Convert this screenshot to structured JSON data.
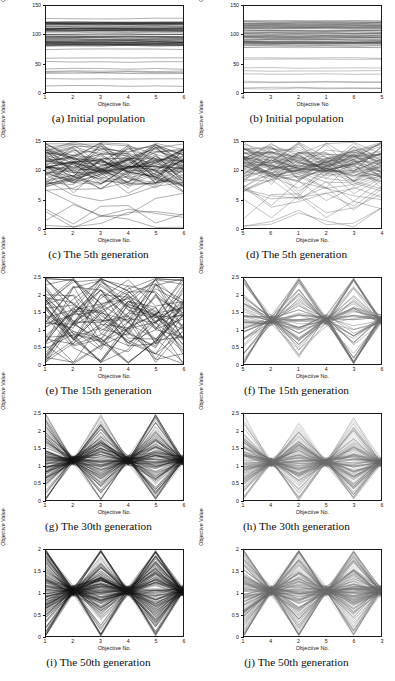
{
  "figure": {
    "axis_titles": {
      "y": "Objective Value",
      "x_dotted": "Objective No.",
      "x_plain": "Objective No"
    },
    "columns": 2,
    "rows": 5
  },
  "chart_data": [
    {
      "id": "a",
      "type": "line",
      "title": "(a) Initial population",
      "xlabel": "Objective No.",
      "ylabel": "Objective Value",
      "categories": [
        "1",
        "2",
        "3",
        "4",
        "5",
        "6"
      ],
      "ylim": [
        0,
        150
      ],
      "yticks": [
        0,
        50,
        100,
        150
      ],
      "ytick_labels": [
        "0",
        "50",
        "100",
        "150"
      ],
      "grid": false,
      "legend": "none",
      "line_color": "#151515",
      "n_lines": 72,
      "band": [
        5,
        140
      ],
      "dense_band": [
        80,
        125
      ],
      "style": "flat-horizontal",
      "seed": 11
    },
    {
      "id": "b",
      "type": "line",
      "title": "(b) Initial population",
      "xlabel": "Objective No",
      "ylabel": "Objective Value",
      "categories": [
        "4",
        "3",
        "2",
        "1",
        "6",
        "5"
      ],
      "ylim": [
        0,
        150
      ],
      "yticks": [
        0,
        50,
        100,
        150
      ],
      "ytick_labels": [
        "0",
        "50",
        "100",
        "150"
      ],
      "grid": false,
      "legend": "none",
      "line_color": "#4c4c4c",
      "n_lines": 72,
      "band": [
        5,
        140
      ],
      "dense_band": [
        80,
        125
      ],
      "style": "flat-horizontal",
      "seed": 12
    },
    {
      "id": "c",
      "type": "line",
      "title": "(c) The 5th generation",
      "xlabel": "Objective No.",
      "ylabel": "Objective Value",
      "categories": [
        "1",
        "2",
        "3",
        "4",
        "5",
        "6"
      ],
      "ylim": [
        0,
        15
      ],
      "yticks": [
        0,
        5,
        10,
        15
      ],
      "ytick_labels": [
        "0",
        "5",
        "10",
        "15"
      ],
      "grid": false,
      "legend": "none",
      "line_color": "#151515",
      "n_lines": 78,
      "band": [
        0.4,
        14.2
      ],
      "dense_band": [
        8.5,
        13
      ],
      "style": "wavy",
      "amp": 2.6,
      "seed": 21
    },
    {
      "id": "d",
      "type": "line",
      "title": "(d) The 5th generation",
      "xlabel": "Objective No.",
      "ylabel": "Objective Value",
      "categories": [
        "5",
        "6",
        "1",
        "2",
        "3",
        "4"
      ],
      "ylim": [
        0,
        15
      ],
      "yticks": [
        0,
        5,
        10,
        15
      ],
      "ytick_labels": [
        "0",
        "5",
        "10",
        "15"
      ],
      "grid": false,
      "legend": "none",
      "line_color": "#4c4c4c",
      "n_lines": 78,
      "band": [
        0.4,
        14.2
      ],
      "dense_band": [
        8.5,
        13
      ],
      "style": "wavy",
      "amp": 2.4,
      "seed": 22
    },
    {
      "id": "e",
      "type": "line",
      "title": "(e) The 15th generation",
      "xlabel": "Objective No.",
      "ylabel": "Objective Value",
      "categories": [
        "1",
        "2",
        "3",
        "4",
        "5",
        "6"
      ],
      "ylim": [
        0,
        2.5
      ],
      "yticks": [
        0,
        0.5,
        1,
        1.5,
        2,
        2.5
      ],
      "ytick_labels": [
        "0",
        "0.5",
        "1",
        "1.5",
        "2",
        "2.5"
      ],
      "grid": false,
      "legend": "none",
      "line_color": "#151515",
      "n_lines": 60,
      "band": [
        0.1,
        2.35
      ],
      "dense_band": [
        0.5,
        2.1
      ],
      "style": "zigzag",
      "amp": 0.75,
      "seed": 31
    },
    {
      "id": "f",
      "type": "line",
      "title": "(f) The 15th generation",
      "xlabel": "Objective No.",
      "ylabel": "Objective Value",
      "categories": [
        "5",
        "2",
        "1",
        "4",
        "3",
        "6"
      ],
      "ylim": [
        0,
        2.5
      ],
      "yticks": [
        0,
        0.5,
        1,
        1.5,
        2,
        2.5
      ],
      "ytick_labels": [
        "0",
        "0.5",
        "1",
        "1.5",
        "2",
        "2.5"
      ],
      "grid": false,
      "legend": "none",
      "line_color": "#6b6b6b",
      "n_lines": 60,
      "band": [
        0.1,
        2.35
      ],
      "dense_band": [
        0.55,
        2.0
      ],
      "style": "pinch",
      "amp": 0.8,
      "seed": 32
    },
    {
      "id": "g",
      "type": "line",
      "title": "(g) The 30th generation",
      "xlabel": "Objective No.",
      "ylabel": "Objective Value",
      "categories": [
        "1",
        "2",
        "3",
        "4",
        "5",
        "6"
      ],
      "ylim": [
        0,
        2.5
      ],
      "yticks": [
        0,
        0.5,
        1,
        1.5,
        2,
        2.5
      ],
      "ytick_labels": [
        "0",
        "0.5",
        "1",
        "1.5",
        "2",
        "2.5"
      ],
      "grid": false,
      "legend": "none",
      "line_color": "#151515",
      "n_lines": 150,
      "band": [
        0.03,
        2.1
      ],
      "dense_band": [
        0.55,
        1.75
      ],
      "style": "pinch",
      "amp": 0.62,
      "seed": 41
    },
    {
      "id": "h",
      "type": "line",
      "title": "(h) The 30th generation",
      "xlabel": "Objective No.",
      "ylabel": "Objective Value",
      "categories": [
        "1",
        "4",
        "2",
        "5",
        "3",
        "6"
      ],
      "ylim": [
        0,
        2.5
      ],
      "yticks": [
        0,
        0.5,
        1,
        1.5,
        2,
        2.5
      ],
      "ytick_labels": [
        "0",
        "0.5",
        "1",
        "1.5",
        "2",
        "2.5"
      ],
      "grid": false,
      "legend": "none",
      "line_color": "#6b6b6b",
      "n_lines": 150,
      "band": [
        0.03,
        2.05
      ],
      "dense_band": [
        0.6,
        1.6
      ],
      "style": "pinch",
      "amp": 0.6,
      "seed": 42
    },
    {
      "id": "i",
      "type": "line",
      "title": "(i) The 50th generation",
      "xlabel": "Objective No.",
      "ylabel": "Objective Value",
      "categories": [
        "1",
        "2",
        "3",
        "4",
        "5",
        "6"
      ],
      "ylim": [
        0,
        2
      ],
      "yticks": [
        0,
        0.5,
        1,
        1.5,
        2
      ],
      "ytick_labels": [
        "0",
        "0.5",
        "1",
        "1.5",
        "2"
      ],
      "grid": false,
      "legend": "none",
      "line_color": "#151515",
      "n_lines": 190,
      "band": [
        0.02,
        1.95
      ],
      "dense_band": [
        0.5,
        1.6
      ],
      "style": "pinch",
      "amp": 0.55,
      "seed": 51
    },
    {
      "id": "j",
      "type": "line",
      "title": "(j) The 50th generation",
      "xlabel": "Objective No.",
      "ylabel": "Objective Value",
      "categories": [
        "1",
        "4",
        "2",
        "5",
        "6",
        "3"
      ],
      "ylim": [
        0,
        2
      ],
      "yticks": [
        0,
        0.5,
        1,
        1.5,
        2
      ],
      "ytick_labels": [
        "0",
        "0.5",
        "1",
        "1.5",
        "2"
      ],
      "grid": false,
      "legend": "none",
      "line_color": "#6b6b6b",
      "n_lines": 190,
      "band": [
        0.02,
        1.95
      ],
      "dense_band": [
        0.55,
        1.55
      ],
      "style": "pinch",
      "amp": 0.56,
      "seed": 52
    }
  ]
}
